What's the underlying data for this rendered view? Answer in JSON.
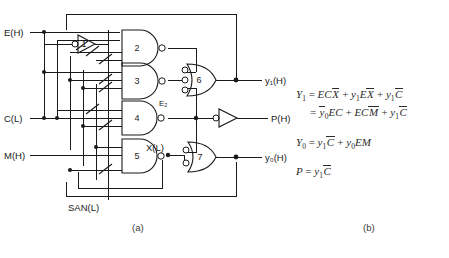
{
  "figure": {
    "caption_a": "(a)",
    "caption_b": "(b)"
  },
  "circuit": {
    "inputs": [
      {
        "name": "input-e",
        "label": "E(H)"
      },
      {
        "name": "input-c",
        "label": "C(L)"
      },
      {
        "name": "input-m",
        "label": "M(H)"
      },
      {
        "name": "input-san",
        "label": "SAN(L)"
      }
    ],
    "outputs": [
      {
        "name": "output-y1",
        "label": "y₁(H)"
      },
      {
        "name": "output-p",
        "label": "P(H)"
      },
      {
        "name": "output-y0",
        "label": "y₀(H)"
      }
    ],
    "internal_nodes": [
      {
        "name": "node-e2",
        "label": "E₂"
      },
      {
        "name": "node-x",
        "label": "X(L)"
      }
    ],
    "gates": [
      {
        "id": "1",
        "type": "inverter",
        "label": "1"
      },
      {
        "id": "2",
        "type": "nand",
        "label": "2"
      },
      {
        "id": "3",
        "type": "nand",
        "label": "3"
      },
      {
        "id": "4",
        "type": "nand",
        "label": "4"
      },
      {
        "id": "5",
        "type": "nand",
        "label": "5"
      },
      {
        "id": "6",
        "type": "nor",
        "label": "6"
      },
      {
        "id": "7",
        "type": "nor",
        "label": "7"
      }
    ],
    "colors": {
      "line": "#1a1a1a",
      "background": "#ffffff",
      "text": "#2b2b2b"
    }
  },
  "equations": {
    "y1_line1_lhs": "Y",
    "y1_line1_sub": "1",
    "y1_line1_rhs_a": "EC",
    "y1_line1_rhs_a_bar": "X",
    "y1_line1_rhs_b_pre": "y",
    "y1_line1_rhs_b_sub": "1",
    "y1_line1_rhs_b_mid": "E",
    "y1_line1_rhs_b_bar": "X",
    "y1_line1_rhs_c_pre": "y",
    "y1_line1_rhs_c_sub": "1",
    "y1_line1_rhs_c_bar": "C",
    "y1_line2_bar_y": "y",
    "y1_line2_sub": "0",
    "y1_line2_a": "EC",
    "y1_line2_b": "EC",
    "y1_line2_b_bar": "M",
    "y1_line2_c_pre": "y",
    "y1_line2_c_sub": "1",
    "y1_line2_c_bar": "C",
    "y0_lhs": "Y",
    "y0_sub": "0",
    "y0_a_pre": "y",
    "y0_a_sub": "1",
    "y0_a_bar": "C",
    "y0_b_pre": "y",
    "y0_b_sub": "0",
    "y0_b_rest": "EM",
    "p_lhs": "P",
    "p_a_pre": "y",
    "p_a_sub": "1",
    "p_a_bar": "C"
  }
}
